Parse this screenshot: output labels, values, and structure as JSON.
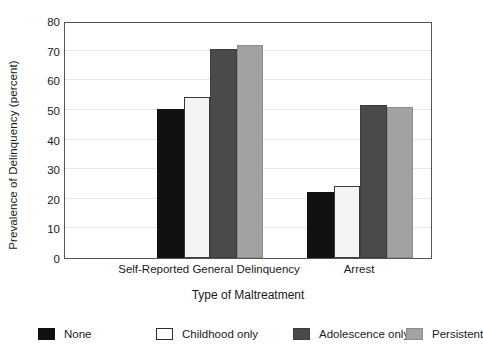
{
  "chart_data": {
    "type": "bar",
    "title": "",
    "subtitle": "",
    "xlabel": "Type of Maltreatment",
    "ylabel": "Prevalence of Delinquency (percent)",
    "categories": [
      "Self-Reported General Delinquency",
      "Arrest"
    ],
    "series": [
      {
        "name": "None",
        "color": "#111111",
        "values": [
          50.3,
          22.2
        ]
      },
      {
        "name": "Childhood only",
        "color": "#ffffff",
        "values": [
          54.5,
          24.2
        ]
      },
      {
        "name": "Adolescence only",
        "color": "#4a4a4a",
        "values": [
          70.5,
          51.8
        ]
      },
      {
        "name": "Persistent",
        "color": "#a2a2a2",
        "values": [
          72.0,
          50.9
        ]
      }
    ],
    "ylim": [
      0,
      80
    ],
    "yticks": [
      0,
      10,
      20,
      30,
      40,
      50,
      60,
      70,
      80
    ],
    "ytick_labels": [
      "0",
      "10",
      "20",
      "30",
      "40",
      "50",
      "60",
      "70",
      "80"
    ],
    "grid": "horizontal",
    "legend_position": "bottom-outside",
    "legend_entries": [
      "None",
      "Childhood only",
      "Adolescence only",
      "Persistent"
    ]
  }
}
